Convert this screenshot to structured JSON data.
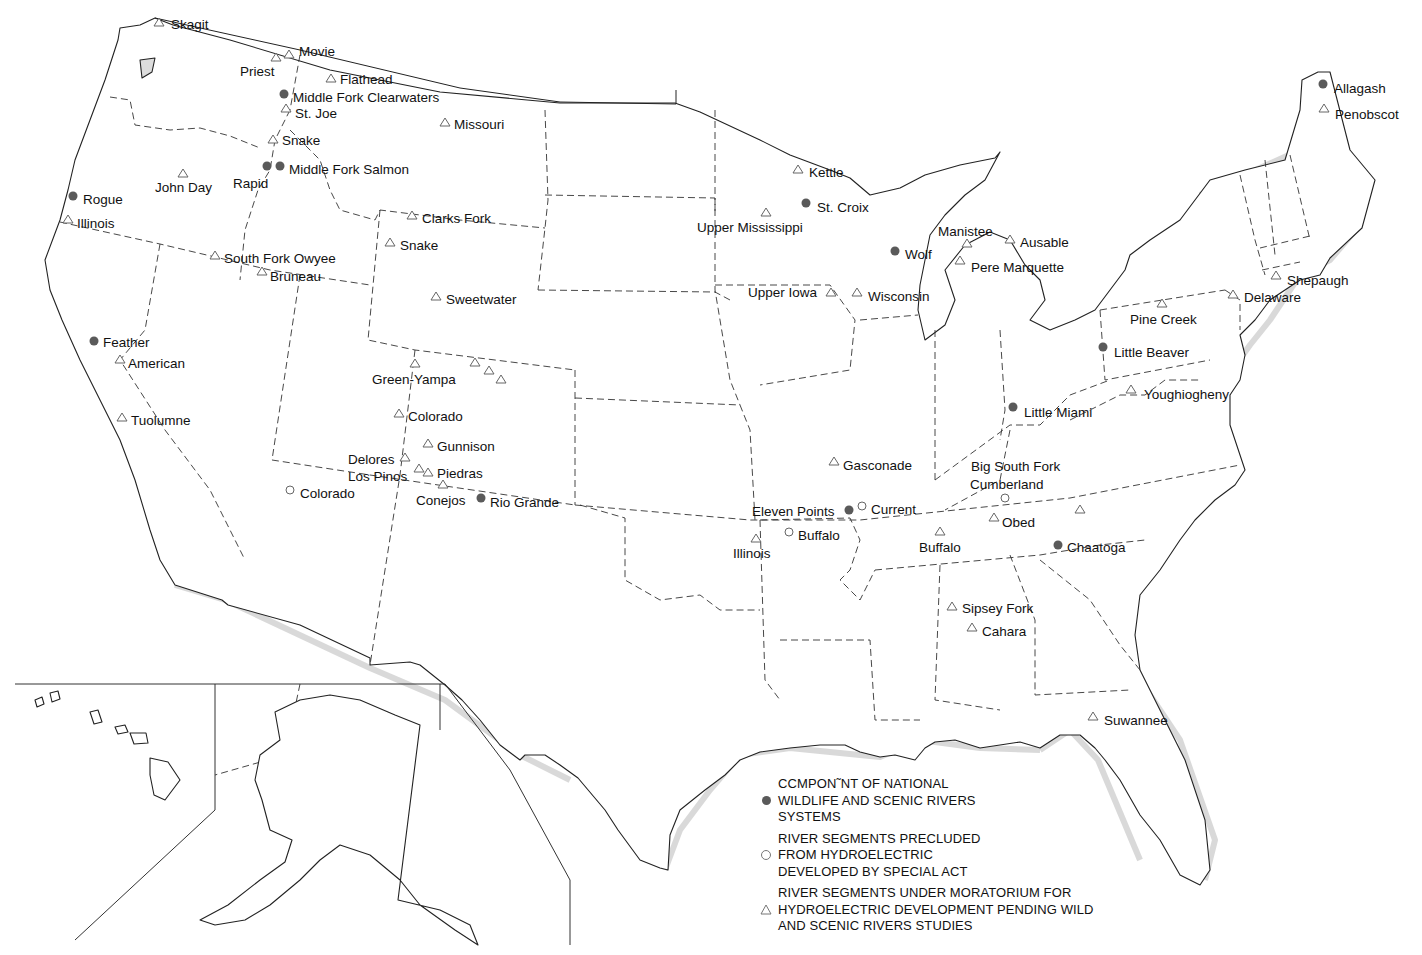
{
  "map": {
    "title": "",
    "colors": {
      "component": "#5a5a5a",
      "precluded": "#ffffff",
      "moratorium": "#ffffff",
      "outline": "#222222"
    }
  },
  "legend": {
    "items": [
      {
        "symbol": "filled-circle",
        "lines": [
          "CCMPON˜NT OF NATIONAL",
          "WILDLIFE AND SCENIC RIVERS",
          "SYSTEMS"
        ]
      },
      {
        "symbol": "open-circle",
        "lines": [
          "RIVER SEGMENTS PRECLUDED",
          "FROM HYDROELECTRIC",
          "DEVELOPED BY SPECIAL ACT"
        ]
      },
      {
        "symbol": "open-triangle",
        "lines": [
          "RIVER SEGMENTS UNDER MORATORIUM FOR",
          "HYDROELECTRIC DEVELOPMENT PENDING WILD",
          "AND SCENIC RIVERS STUDIES"
        ]
      }
    ]
  },
  "rivers": [
    {
      "name": "Skagit",
      "type": "moratorium",
      "x": 159,
      "y": 22,
      "lx": 171,
      "ly": 29
    },
    {
      "name": "Movie",
      "type": "moratorium",
      "x": 289,
      "y": 54,
      "lx": 299,
      "ly": 56
    },
    {
      "name": "",
      "type": "moratorium",
      "x": 276,
      "y": 57,
      "lx": 0,
      "ly": 0
    },
    {
      "name": "Priest",
      "type": "label-only",
      "x": 0,
      "y": 0,
      "lx": 240,
      "ly": 76
    },
    {
      "name": "Flathead",
      "type": "moratorium",
      "x": 331,
      "y": 78,
      "lx": 340,
      "ly": 84
    },
    {
      "name": "Middle Fork Clearwaters",
      "type": "component",
      "x": 284,
      "y": 94,
      "lx": 293,
      "ly": 102
    },
    {
      "name": "St. Joe",
      "type": "moratorium",
      "x": 286,
      "y": 108,
      "lx": 295,
      "ly": 118
    },
    {
      "name": "Missouri",
      "type": "moratorium",
      "x": 445,
      "y": 122,
      "lx": 454,
      "ly": 129
    },
    {
      "name": "Snake",
      "type": "moratorium",
      "x": 273,
      "y": 139,
      "lx": 282,
      "ly": 145
    },
    {
      "name": "Middle Fork Salmon",
      "type": "component",
      "x": 280,
      "y": 166,
      "lx": 289,
      "ly": 174
    },
    {
      "name": "",
      "type": "component",
      "x": 267,
      "y": 166,
      "lx": 0,
      "ly": 0
    },
    {
      "name": "Rapid",
      "type": "label-only",
      "x": 0,
      "y": 0,
      "lx": 233,
      "ly": 188
    },
    {
      "name": "John Day",
      "type": "moratorium",
      "x": 183,
      "y": 173,
      "lx": 155,
      "ly": 192
    },
    {
      "name": "Rogue",
      "type": "component",
      "x": 73,
      "y": 196,
      "lx": 83,
      "ly": 204
    },
    {
      "name": "Illinois",
      "type": "moratorium",
      "x": 68,
      "y": 219,
      "lx": 77,
      "ly": 228
    },
    {
      "name": "Clarks Fork",
      "type": "moratorium",
      "x": 412,
      "y": 215,
      "lx": 422,
      "ly": 223
    },
    {
      "name": "Snake",
      "type": "moratorium",
      "x": 390,
      "y": 242,
      "lx": 400,
      "ly": 250
    },
    {
      "name": "South Fork Owyee",
      "type": "moratorium",
      "x": 215,
      "y": 255,
      "lx": 224,
      "ly": 263
    },
    {
      "name": "Bruneau",
      "type": "moratorium",
      "x": 262,
      "y": 271,
      "lx": 270,
      "ly": 281
    },
    {
      "name": "Sweetwater",
      "type": "moratorium",
      "x": 436,
      "y": 296,
      "lx": 446,
      "ly": 304
    },
    {
      "name": "Feather",
      "type": "component",
      "x": 94,
      "y": 341,
      "lx": 103,
      "ly": 347
    },
    {
      "name": "American",
      "type": "moratorium",
      "x": 120,
      "y": 359,
      "lx": 128,
      "ly": 368
    },
    {
      "name": "Tuolumne",
      "type": "moratorium",
      "x": 122,
      "y": 417,
      "lx": 131,
      "ly": 425
    },
    {
      "name": "",
      "type": "moratorium",
      "x": 415,
      "y": 363,
      "lx": 0,
      "ly": 0
    },
    {
      "name": "",
      "type": "moratorium",
      "x": 475,
      "y": 362,
      "lx": 0,
      "ly": 0
    },
    {
      "name": "",
      "type": "moratorium",
      "x": 489,
      "y": 370,
      "lx": 0,
      "ly": 0
    },
    {
      "name": "",
      "type": "moratorium",
      "x": 501,
      "y": 379,
      "lx": 0,
      "ly": 0
    },
    {
      "name": "Green-Yampa",
      "type": "label-only",
      "x": 0,
      "y": 0,
      "lx": 372,
      "ly": 384
    },
    {
      "name": "Colorado",
      "type": "moratorium",
      "x": 399,
      "y": 413,
      "lx": 408,
      "ly": 421
    },
    {
      "name": "Gunnison",
      "type": "moratorium",
      "x": 428,
      "y": 443,
      "lx": 437,
      "ly": 451
    },
    {
      "name": "Delores",
      "type": "moratorium",
      "x": 405,
      "y": 457,
      "lx": 348,
      "ly": 464
    },
    {
      "name": "Los Pinos",
      "type": "moratorium",
      "x": 419,
      "y": 468,
      "lx": 348,
      "ly": 481
    },
    {
      "name": "Piedras",
      "type": "moratorium",
      "x": 428,
      "y": 472,
      "lx": 437,
      "ly": 478
    },
    {
      "name": "Conejos",
      "type": "moratorium",
      "x": 443,
      "y": 484,
      "lx": 416,
      "ly": 505
    },
    {
      "name": "Rio Grande",
      "type": "component",
      "x": 481,
      "y": 498,
      "lx": 490,
      "ly": 507
    },
    {
      "name": "Colorado",
      "type": "precluded",
      "x": 290,
      "y": 490,
      "lx": 300,
      "ly": 498
    },
    {
      "name": "Kettle",
      "type": "moratorium",
      "x": 798,
      "y": 169,
      "lx": 809,
      "ly": 177
    },
    {
      "name": "St. Croix",
      "type": "component",
      "x": 806,
      "y": 203,
      "lx": 817,
      "ly": 212
    },
    {
      "name": "Upper Mississippi",
      "type": "moratorium",
      "x": 766,
      "y": 212,
      "lx": 697,
      "ly": 232
    },
    {
      "name": "Wolf",
      "type": "component",
      "x": 895,
      "y": 251,
      "lx": 905,
      "ly": 259
    },
    {
      "name": "Manistee",
      "type": "moratorium",
      "x": 967,
      "y": 243,
      "lx": 938,
      "ly": 236
    },
    {
      "name": "Ausable",
      "type": "moratorium",
      "x": 1010,
      "y": 239,
      "lx": 1020,
      "ly": 247
    },
    {
      "name": "Pere Marquette",
      "type": "moratorium",
      "x": 960,
      "y": 260,
      "lx": 971,
      "ly": 272
    },
    {
      "name": "Upper Iowa",
      "type": "moratorium",
      "x": 831,
      "y": 292,
      "lx": 748,
      "ly": 297
    },
    {
      "name": "Wisconsin",
      "type": "moratorium",
      "x": 857,
      "y": 292,
      "lx": 868,
      "ly": 301
    },
    {
      "name": "Allagash",
      "type": "component",
      "x": 1323,
      "y": 84,
      "lx": 1334,
      "ly": 93
    },
    {
      "name": "Penobscot",
      "type": "moratorium",
      "x": 1324,
      "y": 108,
      "lx": 1335,
      "ly": 119
    },
    {
      "name": "Shepaugh",
      "type": "moratorium",
      "x": 1276,
      "y": 275,
      "lx": 1287,
      "ly": 285
    },
    {
      "name": "Delaware",
      "type": "moratorium",
      "x": 1233,
      "y": 294,
      "lx": 1244,
      "ly": 302
    },
    {
      "name": "Pine Creek",
      "type": "moratorium",
      "x": 1162,
      "y": 303,
      "lx": 1130,
      "ly": 324
    },
    {
      "name": "Little Beaver",
      "type": "component",
      "x": 1103,
      "y": 347,
      "lx": 1114,
      "ly": 357
    },
    {
      "name": "Youghiogheny",
      "type": "moratorium",
      "x": 1131,
      "y": 389,
      "lx": 1144,
      "ly": 399
    },
    {
      "name": "Little Miami",
      "type": "component",
      "x": 1013,
      "y": 407,
      "lx": 1024,
      "ly": 417
    },
    {
      "name": "Gasconade",
      "type": "moratorium",
      "x": 834,
      "y": 461,
      "lx": 843,
      "ly": 470
    },
    {
      "name": "Big South Fork",
      "type": "label-only",
      "x": 0,
      "y": 0,
      "lx": 971,
      "ly": 471
    },
    {
      "name": "Cumberland",
      "type": "precluded",
      "x": 1005,
      "y": 498,
      "lx": 970,
      "ly": 489
    },
    {
      "name": "Eleven Points",
      "type": "component",
      "x": 849,
      "y": 510,
      "lx": 752,
      "ly": 516
    },
    {
      "name": "Current",
      "type": "precluded",
      "x": 862,
      "y": 506,
      "lx": 871,
      "ly": 514
    },
    {
      "name": "Obed",
      "type": "moratorium",
      "x": 994,
      "y": 517,
      "lx": 1002,
      "ly": 527
    },
    {
      "name": "Buffalo",
      "type": "precluded",
      "x": 789,
      "y": 532,
      "lx": 798,
      "ly": 540
    },
    {
      "name": "Illinois",
      "type": "moratorium",
      "x": 756,
      "y": 538,
      "lx": 733,
      "ly": 558
    },
    {
      "name": "Buffalo",
      "type": "moratorium",
      "x": 940,
      "y": 531,
      "lx": 919,
      "ly": 552
    },
    {
      "name": "",
      "type": "moratorium",
      "x": 1080,
      "y": 509,
      "lx": 0,
      "ly": 0
    },
    {
      "name": "Chaatoga",
      "type": "component",
      "x": 1058,
      "y": 545,
      "lx": 1067,
      "ly": 552
    },
    {
      "name": "Sipsey Fork",
      "type": "moratorium",
      "x": 952,
      "y": 606,
      "lx": 962,
      "ly": 613
    },
    {
      "name": "Cahara",
      "type": "moratorium",
      "x": 972,
      "y": 627,
      "lx": 982,
      "ly": 636
    },
    {
      "name": "Suwannee",
      "type": "moratorium",
      "x": 1093,
      "y": 716,
      "lx": 1104,
      "ly": 725
    }
  ]
}
